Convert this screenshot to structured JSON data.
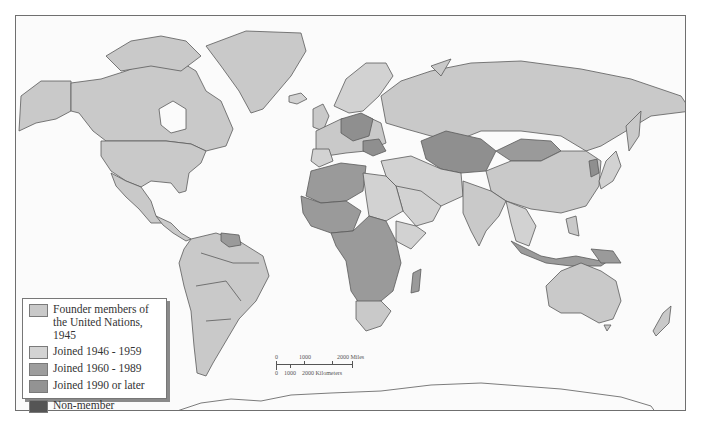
{
  "map": {
    "title": "UN membership world map",
    "colors": {
      "ocean": "#fbfbfb",
      "founder": "#c9c9c9",
      "joined_1946_1959": "#d2d2d2",
      "joined_1960_1989": "#9a9a9a",
      "joined_1990_later": "#8f8f8f",
      "non_member": "#555555",
      "border": "#5a5a5a"
    }
  },
  "legend": {
    "items": [
      {
        "label": "Founder members of the United Nations, 1945",
        "color": "#c9c9c9"
      },
      {
        "label": "Joined 1946 - 1959",
        "color": "#d3d3d3"
      },
      {
        "label": "Joined 1960 - 1989",
        "color": "#9d9d9d"
      },
      {
        "label": "Joined 1990 or later",
        "color": "#939393"
      },
      {
        "label": "Non-member",
        "color": "#555555"
      }
    ]
  },
  "scale_bar": {
    "miles_labels": [
      "0",
      "1000",
      "2000 Miles"
    ],
    "km_labels": [
      "0",
      "1000",
      "2000 Kilometers"
    ]
  }
}
